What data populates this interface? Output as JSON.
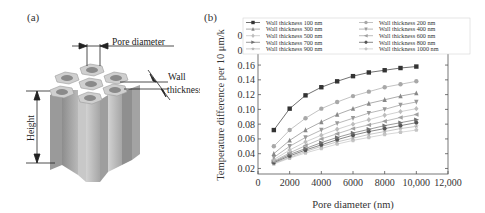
{
  "panel_a": {
    "label": "(a)",
    "annotations": {
      "pore_diameter": "Pore diameter",
      "wall_thickness_line1": "Wall",
      "wall_thickness_line2": "thickness",
      "height": "Height"
    }
  },
  "panel_b": {
    "label": "(b)"
  },
  "chart_data": {
    "type": "line",
    "title": "",
    "xlabel": "Pore diameter (nm)",
    "ylabel": "Temperature difference per 10 μm/k",
    "xlim": [
      0,
      12000
    ],
    "ylim": [
      0.015,
      0.2
    ],
    "x_ticks": [
      "0",
      "2000",
      "4000",
      "6000",
      "8000",
      "10,000",
      "12,000"
    ],
    "y_ticks": [
      "0.02",
      "0.04",
      "0.06",
      "0.08",
      "0.10",
      "0.12",
      "0.14",
      "0.16",
      "0.18",
      "0.20"
    ],
    "grid": false,
    "legend_position": "top, inside, 2 columns",
    "x": [
      1000,
      2000,
      3000,
      4000,
      5000,
      6000,
      7000,
      8000,
      9000,
      10000
    ],
    "series": [
      {
        "name": "Wall thickness  100 nm",
        "marker": "square",
        "color": "#333333",
        "values": [
          0.072,
          0.101,
          0.119,
          0.13,
          0.138,
          0.145,
          0.15,
          0.153,
          0.156,
          0.158
        ]
      },
      {
        "name": "Wall thickness  200 nm",
        "marker": "circle",
        "color": "#a8a8a8",
        "values": [
          0.05,
          0.072,
          0.088,
          0.101,
          0.11,
          0.118,
          0.124,
          0.13,
          0.134,
          0.138
        ]
      },
      {
        "name": "Wall thickness  300 nm",
        "marker": "triangle-up",
        "color": "#888888",
        "values": [
          0.04,
          0.058,
          0.072,
          0.083,
          0.093,
          0.101,
          0.108,
          0.113,
          0.118,
          0.122
        ]
      },
      {
        "name": "Wall thickness  400 nm",
        "marker": "triangle-down",
        "color": "#9a9a9a",
        "values": [
          0.035,
          0.05,
          0.062,
          0.072,
          0.081,
          0.088,
          0.095,
          0.1,
          0.106,
          0.11
        ]
      },
      {
        "name": "Wall thickness  500 nm",
        "marker": "diamond",
        "color": "#bdbdbd",
        "values": [
          0.032,
          0.045,
          0.056,
          0.065,
          0.073,
          0.08,
          0.086,
          0.092,
          0.097,
          0.101
        ]
      },
      {
        "name": "Wall thickness  600 nm",
        "marker": "triangle-left",
        "color": "#a0a0a0",
        "values": [
          0.03,
          0.041,
          0.051,
          0.06,
          0.067,
          0.074,
          0.079,
          0.084,
          0.089,
          0.093
        ]
      },
      {
        "name": "Wall thickness  700 nm",
        "marker": "triangle-right",
        "color": "#707070",
        "values": [
          0.029,
          0.039,
          0.047,
          0.055,
          0.062,
          0.068,
          0.073,
          0.078,
          0.082,
          0.086
        ]
      },
      {
        "name": "Wall thickness  800 nm",
        "marker": "hexagon",
        "color": "#555555",
        "values": [
          0.028,
          0.037,
          0.045,
          0.052,
          0.059,
          0.065,
          0.07,
          0.074,
          0.078,
          0.082
        ]
      },
      {
        "name": "Wall thickness  900 nm",
        "marker": "star",
        "color": "#b0b0b0",
        "values": [
          0.027,
          0.035,
          0.043,
          0.05,
          0.056,
          0.061,
          0.066,
          0.07,
          0.074,
          0.077
        ]
      },
      {
        "name": "Wall thickness  1000 nm",
        "marker": "pentagon",
        "color": "#c4c4c4",
        "values": [
          0.026,
          0.034,
          0.041,
          0.047,
          0.053,
          0.058,
          0.062,
          0.066,
          0.069,
          0.072
        ]
      }
    ]
  }
}
